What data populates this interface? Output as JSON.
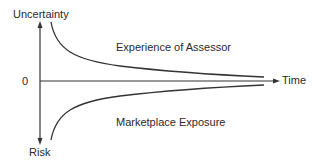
{
  "diagram": {
    "title": "",
    "axes": {
      "y_top_label": "Uncertainty",
      "y_bottom_label": "Risk",
      "origin_label": "0",
      "x_label": "Time"
    },
    "curves": [
      {
        "name": "upper",
        "label": "Experience of Assessor",
        "shape": "decaying curve from high uncertainty converging toward time axis"
      },
      {
        "name": "lower",
        "label": "Marketplace Exposure",
        "shape": "mirror decaying curve from high risk converging toward time axis"
      }
    ],
    "colors": {
      "line": "#333333",
      "text": "#2a2a2a",
      "background": "#ffffff"
    }
  }
}
